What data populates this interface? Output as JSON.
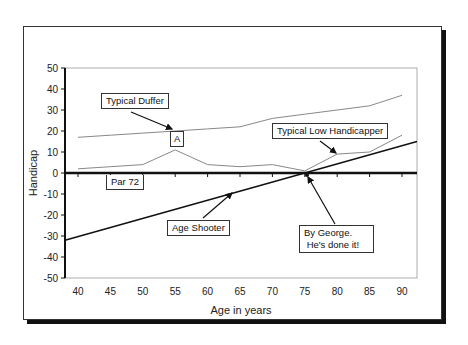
{
  "chart_data": {
    "type": "line",
    "title": "",
    "xlabel": "Age in years",
    "ylabel": "Handicap",
    "xlim": [
      38,
      92
    ],
    "ylim": [
      -50,
      50
    ],
    "x_ticks": [
      40,
      45,
      50,
      55,
      60,
      65,
      70,
      75,
      80,
      85,
      90
    ],
    "y_ticks": [
      50,
      40,
      30,
      20,
      10,
      0,
      -10,
      -20,
      -30,
      -40,
      -50
    ],
    "grid": false,
    "legend": "none (callout labels)",
    "x": [
      40,
      45,
      50,
      55,
      60,
      65,
      70,
      75,
      80,
      85,
      90
    ],
    "series": [
      {
        "name": "Typical Duffer",
        "values": [
          17,
          18,
          19,
          20,
          21,
          22,
          26,
          28,
          30,
          32,
          37
        ],
        "color": "#888888",
        "width": 1
      },
      {
        "name": "Typical Low Handicapper",
        "values": [
          2,
          3,
          4,
          11,
          4,
          3,
          4,
          1,
          9,
          10,
          18
        ],
        "color": "#888888",
        "width": 1
      },
      {
        "name": "Age Shooter",
        "x": [
          38,
          92
        ],
        "values": [
          -32,
          15
        ],
        "color": "#111111",
        "width": 1.5
      },
      {
        "name": "Par 72",
        "x": [
          38,
          92
        ],
        "values": [
          0,
          0
        ],
        "color": "#111111",
        "width": 2.5
      }
    ],
    "annotations": [
      {
        "text": "Typical Duffer",
        "points_to": [
          55,
          20
        ]
      },
      {
        "text": "A",
        "at": [
          55,
          15
        ]
      },
      {
        "text": "Typical Low Handicapper",
        "points_to": [
          80,
          9
        ]
      },
      {
        "text": "Par 72",
        "at": [
          48,
          -4
        ]
      },
      {
        "text": "Age Shooter",
        "points_to": [
          64,
          -8
        ]
      },
      {
        "text": "By George.\n He's done it!",
        "points_to": [
          75,
          0
        ]
      }
    ]
  },
  "labels": {
    "ylabel": "Handicap",
    "xlabel": "Age in years",
    "duffer": "Typical Duffer",
    "a_marker": "A",
    "low_handicapper": "Typical Low Handicapper",
    "par": "Par 72",
    "age_shooter": "Age Shooter",
    "by_george": "By George.\n He's done it!"
  }
}
